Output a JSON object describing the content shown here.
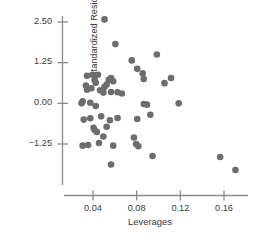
{
  "chart_data": {
    "type": "scatter",
    "title": "",
    "xlabel": "Leverages",
    "ylabel": "Standardized Residuals",
    "xticks": [
      "0.04",
      "0.08",
      "0.12",
      "0.16"
    ],
    "xtick_values": [
      0.04,
      0.08,
      0.12,
      0.16
    ],
    "yticks": [
      "2.50",
      "1.25",
      "0.00",
      "−1.25"
    ],
    "ytick_values": [
      2.5,
      1.25,
      0.0,
      -1.25
    ],
    "xlim": [
      0.018,
      0.182
    ],
    "ylim": [
      -2.45,
      2.95
    ],
    "grid": false,
    "legend": null,
    "marker_color": "#6d6d6d",
    "marker_size": 3.3,
    "axis_color": "#7a7a7a",
    "points": [
      [
        0.0505,
        2.58
      ],
      [
        0.0605,
        1.82
      ],
      [
        0.0755,
        1.32
      ],
      [
        0.0805,
        1.06
      ],
      [
        0.0985,
        1.5
      ],
      [
        0.0855,
        0.92
      ],
      [
        0.0865,
        0.75
      ],
      [
        0.1115,
        0.78
      ],
      [
        0.1055,
        0.62
      ],
      [
        0.0345,
        0.85
      ],
      [
        0.0395,
        0.88
      ],
      [
        0.0445,
        0.88
      ],
      [
        0.0415,
        0.72
      ],
      [
        0.0425,
        0.63
      ],
      [
        0.0545,
        0.72
      ],
      [
        0.0565,
        0.78
      ],
      [
        0.0585,
        0.68
      ],
      [
        0.0525,
        0.58
      ],
      [
        0.0505,
        0.5
      ],
      [
        0.0335,
        0.55
      ],
      [
        0.0345,
        0.42
      ],
      [
        0.0385,
        0.46
      ],
      [
        0.0465,
        0.4
      ],
      [
        0.0495,
        0.33
      ],
      [
        0.0565,
        0.35
      ],
      [
        0.0625,
        0.34
      ],
      [
        0.0665,
        0.3
      ],
      [
        0.0305,
        0.06
      ],
      [
        0.0295,
        0.0
      ],
      [
        0.0375,
        0.02
      ],
      [
        0.0425,
        -0.08
      ],
      [
        0.0865,
        -0.02
      ],
      [
        0.0895,
        -0.04
      ],
      [
        0.1185,
        0.0
      ],
      [
        0.0925,
        -0.35
      ],
      [
        0.0805,
        -0.48
      ],
      [
        0.0315,
        -0.5
      ],
      [
        0.0375,
        -0.46
      ],
      [
        0.0475,
        -0.4
      ],
      [
        0.0555,
        -0.52
      ],
      [
        0.0625,
        -0.45
      ],
      [
        0.0405,
        -0.75
      ],
      [
        0.0415,
        -0.82
      ],
      [
        0.0435,
        -0.88
      ],
      [
        0.0525,
        -0.72
      ],
      [
        0.0495,
        -1.02
      ],
      [
        0.0305,
        -1.3
      ],
      [
        0.0355,
        -1.28
      ],
      [
        0.0455,
        -1.22
      ],
      [
        0.0585,
        -1.3
      ],
      [
        0.0795,
        -1.25
      ],
      [
        0.0815,
        -1.32
      ],
      [
        0.0775,
        -1.05
      ],
      [
        0.0945,
        -1.62
      ],
      [
        0.0565,
        -1.88
      ],
      [
        0.1565,
        -1.65
      ],
      [
        0.1705,
        -2.05
      ]
    ]
  },
  "axes": {
    "x_axis_line": true,
    "y_axis_line": true
  }
}
